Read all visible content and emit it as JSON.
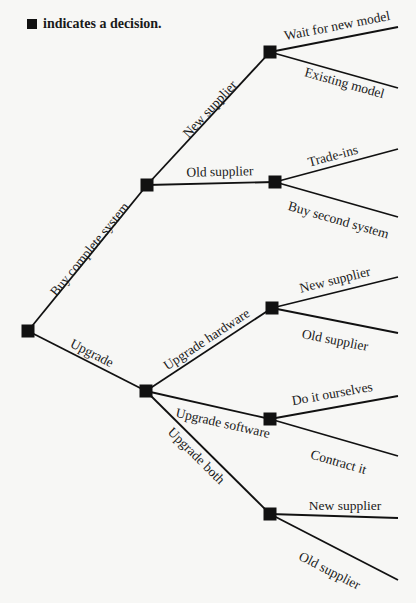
{
  "legend": {
    "text": "indicates a decision.",
    "icon": "decision-square-icon"
  },
  "colors": {
    "ink": "#111111",
    "background": "#f7f7f5"
  },
  "nodes": [
    {
      "id": "root",
      "x": 28,
      "y": 331
    },
    {
      "id": "buy",
      "x": 147,
      "y": 185
    },
    {
      "id": "buy-new",
      "x": 270,
      "y": 52
    },
    {
      "id": "buy-old",
      "x": 275,
      "y": 182
    },
    {
      "id": "upgrade",
      "x": 146,
      "y": 391
    },
    {
      "id": "upg-hw",
      "x": 272,
      "y": 308
    },
    {
      "id": "upg-sw",
      "x": 270,
      "y": 419
    },
    {
      "id": "upg-both",
      "x": 270,
      "y": 514
    }
  ],
  "branches": [
    {
      "from": [
        28,
        331
      ],
      "to": [
        147,
        185
      ],
      "label": "Buy complete system",
      "lx": 93,
      "ly": 252,
      "angle": -50.8,
      "pos": "above"
    },
    {
      "from": [
        28,
        331
      ],
      "to": [
        146,
        391
      ],
      "label": "Upgrade",
      "lx": 90,
      "ly": 357,
      "angle": 27,
      "pos": "above"
    },
    {
      "from": [
        147,
        185
      ],
      "to": [
        270,
        52
      ],
      "label": "New supplier",
      "lx": 213,
      "ly": 112,
      "angle": -47.2,
      "pos": "above"
    },
    {
      "from": [
        147,
        185
      ],
      "to": [
        275,
        182
      ],
      "label": "Old supplier",
      "lx": 220,
      "ly": 176,
      "angle": -1.3,
      "pos": "above"
    },
    {
      "from": [
        270,
        52
      ],
      "to": [
        398,
        27
      ],
      "label": "Wait for new model",
      "lx": 338,
      "ly": 30,
      "angle": -11,
      "pos": "above"
    },
    {
      "from": [
        270,
        52
      ],
      "to": [
        398,
        88
      ],
      "label": "Existing model",
      "lx": 346,
      "ly": 78,
      "angle": 15.7,
      "pos": "below"
    },
    {
      "from": [
        275,
        182
      ],
      "to": [
        398,
        149
      ],
      "label": "Trade-ins",
      "lx": 334,
      "ly": 160,
      "angle": -15,
      "pos": "above"
    },
    {
      "from": [
        275,
        182
      ],
      "to": [
        398,
        217
      ],
      "label": "Buy second system",
      "lx": 340,
      "ly": 215,
      "angle": 16,
      "pos": "below"
    },
    {
      "from": [
        146,
        391
      ],
      "to": [
        272,
        308
      ],
      "label": "Upgrade hardware",
      "lx": 209,
      "ly": 343,
      "angle": -33.4,
      "pos": "above"
    },
    {
      "from": [
        146,
        391
      ],
      "to": [
        270,
        419
      ],
      "label": "Upgrade software",
      "lx": 224,
      "ly": 418,
      "angle": 12.7,
      "pos": "below"
    },
    {
      "from": [
        146,
        391
      ],
      "to": [
        270,
        514
      ],
      "label": "Upgrade both",
      "lx": 200,
      "ly": 452,
      "angle": 44.8,
      "pos": "below"
    },
    {
      "from": [
        272,
        308
      ],
      "to": [
        398,
        277
      ],
      "label": "New supplier",
      "lx": 336,
      "ly": 284,
      "angle": -13.8,
      "pos": "above"
    },
    {
      "from": [
        272,
        308
      ],
      "to": [
        398,
        333
      ],
      "label": "Old supplier",
      "lx": 336,
      "ly": 335,
      "angle": 11.2,
      "pos": "below"
    },
    {
      "from": [
        270,
        419
      ],
      "to": [
        398,
        396
      ],
      "label": "Do it ourselves",
      "lx": 333,
      "ly": 398,
      "angle": -10.2,
      "pos": "above"
    },
    {
      "from": [
        270,
        419
      ],
      "to": [
        398,
        456
      ],
      "label": "Contract it",
      "lx": 340,
      "ly": 457,
      "angle": 16.1,
      "pos": "below"
    },
    {
      "from": [
        270,
        514
      ],
      "to": [
        398,
        518
      ],
      "label": "New supplier",
      "lx": 345,
      "ly": 510,
      "angle": 0,
      "pos": "above"
    },
    {
      "from": [
        270,
        514
      ],
      "to": [
        398,
        580
      ],
      "label": "Old supplier",
      "lx": 332,
      "ly": 566,
      "angle": 27.3,
      "pos": "below"
    }
  ]
}
